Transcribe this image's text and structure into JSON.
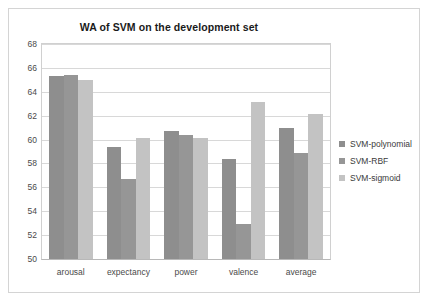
{
  "chart_data": {
    "type": "bar",
    "title": "WA of SVM on the development set",
    "xlabel": "",
    "ylabel": "",
    "ylim": [
      50,
      68
    ],
    "yticks": [
      50,
      52,
      54,
      56,
      58,
      60,
      62,
      64,
      66,
      68
    ],
    "grid": true,
    "legend_position": "right",
    "categories": [
      "arousal",
      "expectancy",
      "power",
      "valence",
      "average"
    ],
    "series": [
      {
        "name": "SVM-polynomial",
        "color": "#8e8e8e",
        "values": [
          65.3,
          59.4,
          60.7,
          58.4,
          61.0
        ]
      },
      {
        "name": "SVM-RBF",
        "color": "#969696",
        "values": [
          65.4,
          56.7,
          60.35,
          52.9,
          58.9
        ]
      },
      {
        "name": "SVM-sigmoid",
        "color": "#c3c3c3",
        "values": [
          65.0,
          60.1,
          60.15,
          63.15,
          62.1
        ]
      }
    ]
  },
  "colors": {
    "frame_border": "#d4d4d4",
    "gridline": "#d8d8d8",
    "axis": "#b8b8b8",
    "title_text": "#1a1a1a",
    "tick_text": "#4a4a4a",
    "legend_text": "#3a3a3a",
    "background": "#ffffff"
  }
}
